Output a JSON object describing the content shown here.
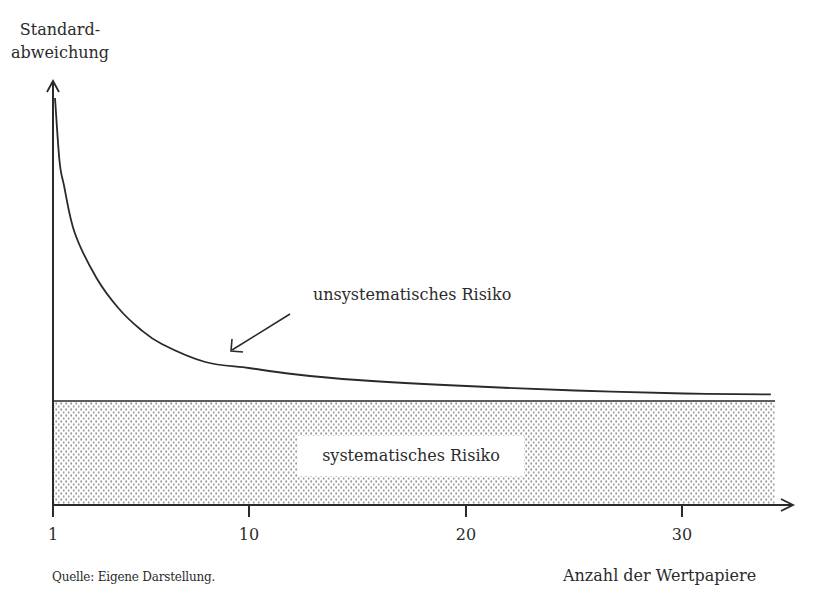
{
  "figure": {
    "y_axis_label_lines": [
      "Standard-",
      "abweichung"
    ],
    "x_axis_label": "Anzahl der Wertpapiere",
    "source_note": "Quelle: Eigene Darstellung.",
    "annotations": {
      "unsystematic": "unsystematisches Risiko",
      "systematic": "systematisches Risiko"
    },
    "x_ticks": [
      {
        "value": 1,
        "label": "1"
      },
      {
        "value": 10,
        "label": "10"
      },
      {
        "value": 20,
        "label": "20"
      },
      {
        "value": 30,
        "label": "30"
      }
    ],
    "colors": {
      "line": "#2a2a2a",
      "stipple_dot": "#9a9a9a",
      "background": "#ffffff"
    }
  },
  "chart_data": {
    "type": "area",
    "title": "",
    "xlabel": "Anzahl der Wertpapiere",
    "ylabel": "Standardabweichung",
    "x_ticks": [
      1,
      10,
      20,
      30
    ],
    "xlim": [
      1,
      34
    ],
    "grid": false,
    "legend": "none (inline annotations)",
    "series": [
      {
        "name": "Gesamtrisiko (unsystematisches + systematisches Risiko)",
        "style": "line",
        "x": [
          1,
          1.3,
          1.5,
          2,
          3,
          4,
          5,
          6,
          8,
          10,
          12,
          15,
          20,
          25,
          30,
          34
        ],
        "y_relative": [
          1.0,
          0.79,
          0.71,
          0.55,
          0.4,
          0.3,
          0.23,
          0.18,
          0.12,
          0.1,
          0.08,
          0.06,
          0.04,
          0.025,
          0.015,
          0.012
        ]
      },
      {
        "name": "systematisches Risiko",
        "style": "stippled-area",
        "x": [
          1,
          34
        ],
        "y_relative": [
          0,
          0
        ],
        "note": "constant floor level; area between floor and x-axis is shaded"
      }
    ],
    "annotations": [
      {
        "text": "unsystematisches Risiko",
        "arrow_to_x": 9,
        "arrow_to": "curve above systematic floor"
      },
      {
        "text": "systematisches Risiko",
        "position": "inside stippled area"
      }
    ],
    "pixel_mapping": {
      "x_axis_y": 505,
      "y_axis_x": 53,
      "systematic_level_y": 401,
      "curve_start_y": 98,
      "px_per_unit_x": 21.75
    }
  }
}
